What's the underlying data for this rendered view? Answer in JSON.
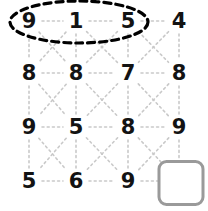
{
  "puzzle": {
    "type": "number-grid-sequence",
    "rows": 4,
    "cols": 4,
    "grid": [
      [
        "9",
        "1",
        "5",
        "4"
      ],
      [
        "8",
        "8",
        "7",
        "8"
      ],
      [
        "9",
        "5",
        "8",
        "9"
      ],
      [
        "5",
        "6",
        "9",
        ""
      ]
    ],
    "answer_cell": {
      "row": 3,
      "col": 3,
      "value": ""
    },
    "highlight": {
      "shape": "ellipse",
      "style": "dashed",
      "color": "#000000",
      "encircles": [
        "9",
        "1",
        "5"
      ],
      "row": 0,
      "cols": [
        0,
        1,
        2
      ]
    },
    "colors": {
      "digit": "#131313",
      "connector": "#c9c9c9",
      "answer_box_border": "#9a9a9a",
      "highlight_stroke": "#000000",
      "background": "#ffffff"
    },
    "connectors": {
      "style": "dotted",
      "horizontal": true,
      "vertical": true,
      "diagonal_cross": true
    }
  },
  "geometry": {
    "col_x": [
      29,
      76,
      128,
      179
    ],
    "row_y": [
      21,
      73,
      127,
      181
    ],
    "box": {
      "cx": 181,
      "cy": 183,
      "w": 47,
      "h": 46
    },
    "ellipse": {
      "cx": 79,
      "cy": 22,
      "rx": 69,
      "ry": 21
    }
  }
}
